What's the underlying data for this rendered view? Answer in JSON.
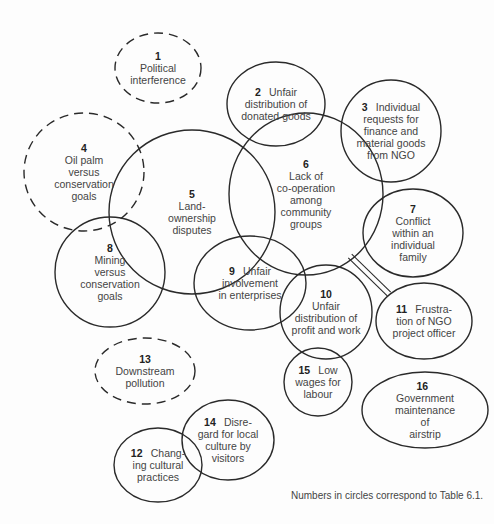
{
  "diagram": {
    "type": "conflict-overlap-diagram",
    "caption": "Numbers in circles correspond to Table 6.1.",
    "style": {
      "stroke": "#2a2a2a",
      "stroke_width": 1.4,
      "dash_pattern": "9 6",
      "background": "#fdfdfd",
      "text_color": "#444444"
    },
    "nodes": [
      {
        "id": "1",
        "number": "1",
        "text": "Political\ninterference",
        "layout": "above",
        "dashed": true,
        "cx": 158,
        "cy": 68,
        "rx": 43,
        "ry": 35
      },
      {
        "id": "2",
        "number": "2",
        "text": "Unfair\ndistribution of\ndonated goods",
        "layout": "inline",
        "dashed": false,
        "cx": 276,
        "cy": 104,
        "rx": 49,
        "ry": 42
      },
      {
        "id": "3",
        "number": "3",
        "text": "Individual\nrequests for\nfinance and\nmaterial goods\nfrom NGO",
        "layout": "inline",
        "dashed": false,
        "cx": 391,
        "cy": 131,
        "rx": 50,
        "ry": 51
      },
      {
        "id": "4",
        "number": "4",
        "text": "Oil palm\nversus\nconservation\ngoals",
        "layout": "above",
        "dashed": true,
        "cx": 84,
        "cy": 172,
        "rx": 60,
        "ry": 59
      },
      {
        "id": "5",
        "number": "5",
        "text": "Land-\nownership\ndisputes",
        "layout": "above",
        "dashed": false,
        "cx": 192,
        "cy": 212,
        "rx": 83,
        "ry": 82
      },
      {
        "id": "6",
        "number": "6",
        "text": "Lack of\nco-operation\namong\ncommunity\ngroups",
        "layout": "above",
        "dashed": false,
        "cx": 306,
        "cy": 194,
        "rx": 77,
        "ry": 81
      },
      {
        "id": "7",
        "number": "7",
        "text": "Conflict\nwithin an\nindividual\nfamily",
        "layout": "above",
        "dashed": false,
        "cx": 413,
        "cy": 233,
        "rx": 50,
        "ry": 44
      },
      {
        "id": "8",
        "number": "8",
        "text": "Mining\nversus\nconservation\ngoals",
        "layout": "above",
        "dashed": false,
        "cx": 110,
        "cy": 272,
        "rx": 55,
        "ry": 55
      },
      {
        "id": "9",
        "number": "9",
        "text": "Unfair\ninvolvement\nin enterprises",
        "layout": "inline",
        "dashed": false,
        "cx": 250,
        "cy": 283,
        "rx": 56,
        "ry": 47
      },
      {
        "id": "10",
        "number": "10",
        "text": "Unfair\ndistribution of\nprofit and work",
        "layout": "above",
        "dashed": false,
        "cx": 326,
        "cy": 312,
        "rx": 46,
        "ry": 47
      },
      {
        "id": "11",
        "number": "11",
        "text": "Frustra-\ntion of NGO\nproject officer",
        "layout": "inline",
        "dashed": false,
        "cx": 424,
        "cy": 321,
        "rx": 48,
        "ry": 38
      },
      {
        "id": "12",
        "number": "12",
        "text": "Chang-\ning cultural\npractices",
        "layout": "inline",
        "dashed": false,
        "cx": 158,
        "cy": 465,
        "rx": 44,
        "ry": 37
      },
      {
        "id": "13",
        "number": "13",
        "text": "Downstream\npollution",
        "layout": "above",
        "dashed": true,
        "cx": 145,
        "cy": 371,
        "rx": 50,
        "ry": 33
      },
      {
        "id": "14",
        "number": "14",
        "text": "Disre-\ngard for local\nculture by\nvisitors",
        "layout": "inline",
        "dashed": false,
        "cx": 228,
        "cy": 440,
        "rx": 46,
        "ry": 40
      },
      {
        "id": "15",
        "number": "15",
        "text": "Low\nwages for\nlabour",
        "layout": "inline",
        "dashed": false,
        "cx": 318,
        "cy": 382,
        "rx": 34,
        "ry": 34
      },
      {
        "id": "16",
        "number": "16",
        "text": "Government\nmaintenance of\nairstrip",
        "layout": "inline",
        "dashed": false,
        "cx": 425,
        "cy": 410,
        "rx": 63,
        "ry": 38
      }
    ],
    "connectors": [
      {
        "from": "6",
        "to": "11",
        "x1": 350,
        "y1": 256,
        "x2": 389,
        "y2": 294
      }
    ]
  }
}
